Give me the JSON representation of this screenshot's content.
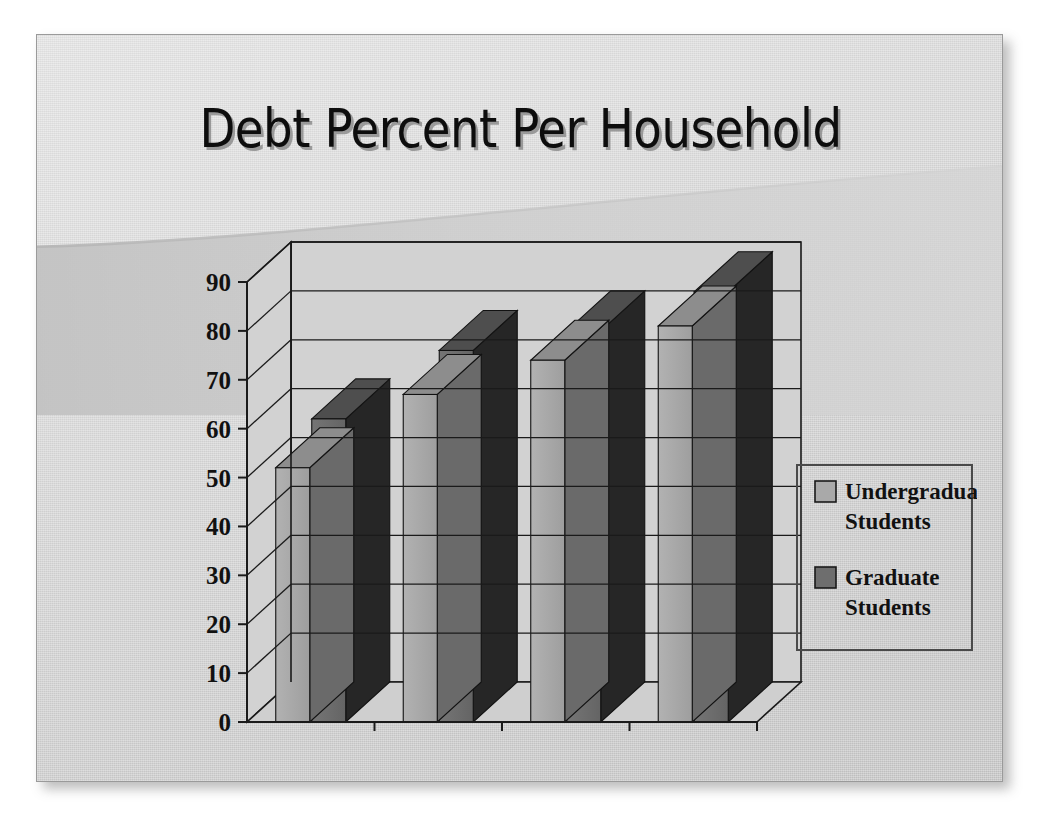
{
  "slide": {
    "title": "Debt Percent Per Household",
    "background_color": "#d6d6d6",
    "border_color": "#9a9a9a"
  },
  "chart_data": {
    "type": "bar",
    "title": "Debt Percent Per Household",
    "subtitle": "",
    "xlabel": "",
    "ylabel": "",
    "categories": [
      "15 Years Ago",
      "10 Years Ago",
      "5 Years Ago",
      "Today"
    ],
    "category_lines": [
      [
        "15 Years",
        "Ago"
      ],
      [
        "10 Years",
        "Ago"
      ],
      [
        "5 Years",
        "Ago"
      ],
      [
        "Today",
        ""
      ]
    ],
    "series": [
      {
        "name": "Undergraduate Students",
        "values": [
          52,
          67,
          74,
          81
        ],
        "color": "#a9a9a9"
      },
      {
        "name": "Graduate Students",
        "values": [
          62,
          76,
          80,
          88
        ],
        "color": "#6e6e6e"
      }
    ],
    "ylim": [
      0,
      90
    ],
    "yticks": [
      0,
      10,
      20,
      30,
      40,
      50,
      60,
      70,
      80,
      90
    ],
    "ytick_labels": [
      "0",
      "10",
      "20",
      "30",
      "40",
      "50",
      "60",
      "70",
      "80",
      "90"
    ],
    "grid": true,
    "legend_position": "right",
    "three_d": true,
    "plot_bg_color": "#d2d2d2",
    "axis_color": "#1a1a1a"
  },
  "legend": {
    "entries": [
      {
        "label_line1": "Undergraduate",
        "label_line2": "Students",
        "swatch_color": "#a9a9a9"
      },
      {
        "label_line1": "Graduate",
        "label_line2": "Students",
        "swatch_color": "#6e6e6e"
      }
    ],
    "border_color": "#4a4a4a"
  }
}
